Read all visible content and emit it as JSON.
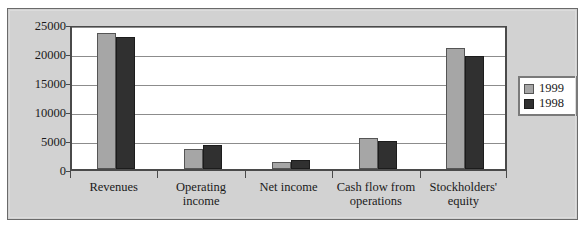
{
  "chart_data": {
    "type": "bar",
    "title": "",
    "subtitle": "",
    "xlabel": "",
    "ylabel": "",
    "ylim": [
      0,
      25000
    ],
    "ytick_values": [
      0,
      5000,
      10000,
      15000,
      20000,
      25000
    ],
    "ytick_labels": [
      "0",
      "5000",
      "10000",
      "15000",
      "20000",
      "25000"
    ],
    "grid": true,
    "legend_position": "right",
    "categories": [
      "Revenues",
      "Operating income",
      "Net income",
      "Cash flow from operations",
      "Stockholders' equity"
    ],
    "series": [
      {
        "name": "1999",
        "color": "#a6a6a6",
        "values": [
          23400,
          3400,
          1200,
          5300,
          20900
        ]
      },
      {
        "name": "1998",
        "color": "#303030",
        "values": [
          22700,
          4200,
          1550,
          4850,
          19400
        ]
      }
    ]
  },
  "legend": {
    "items": [
      {
        "label": "1999",
        "swatch": "swatch-1999"
      },
      {
        "label": "1998",
        "swatch": "swatch-1998"
      }
    ]
  }
}
